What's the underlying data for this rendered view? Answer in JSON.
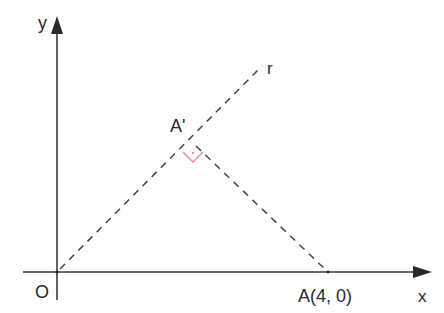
{
  "diagram": {
    "type": "geometry",
    "axes": {
      "x_label": "x",
      "y_label": "y",
      "origin_label": "O"
    },
    "points": {
      "origin": {
        "label": "O"
      },
      "A": {
        "label": "A(4, 0)",
        "coords": [
          4,
          0
        ]
      },
      "A_prime": {
        "label": "A'"
      }
    },
    "lines": {
      "r": {
        "label": "r",
        "style": "dashed"
      },
      "AA_prime": {
        "style": "dashed",
        "perpendicular_to": "r"
      }
    },
    "colors": {
      "axis": "#3a3a3a",
      "dashed_line": "#444444",
      "right_angle_marker": "#e889a8",
      "text": "#2a2a2a"
    }
  }
}
